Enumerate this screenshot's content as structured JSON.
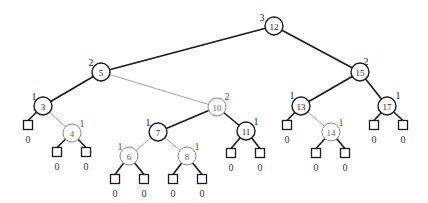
{
  "diagram": {
    "type": "red-black-tree-with-black-heights",
    "colors": {
      "black": "#1a1a1a",
      "red": "#8a8a8a",
      "background": "#ffffff"
    },
    "nodes": [
      {
        "id": "n12",
        "key": "12",
        "height": "3",
        "color": "black",
        "x": 274,
        "y": 26,
        "hx": 262,
        "hy": 17
      },
      {
        "id": "n5",
        "key": "5",
        "height": "2",
        "color": "black",
        "x": 101,
        "y": 72,
        "hx": 91,
        "hy": 62
      },
      {
        "id": "n15",
        "key": "15",
        "height": "2",
        "color": "black",
        "x": 360,
        "y": 72,
        "hx": 366,
        "hy": 61
      },
      {
        "id": "n3",
        "key": "3",
        "height": "1",
        "color": "black",
        "x": 43,
        "y": 106,
        "hx": 34,
        "hy": 96
      },
      {
        "id": "n10",
        "key": "10",
        "height": "2",
        "color": "red",
        "x": 217,
        "y": 107,
        "hx": 227,
        "hy": 96
      },
      {
        "id": "n13",
        "key": "13",
        "height": "1",
        "color": "black",
        "x": 301,
        "y": 106,
        "hx": 292,
        "hy": 95
      },
      {
        "id": "n17",
        "key": "17",
        "height": "1",
        "color": "black",
        "x": 387,
        "y": 106,
        "hx": 398,
        "hy": 95
      },
      {
        "id": "n4",
        "key": "4",
        "height": "1",
        "color": "red",
        "x": 72,
        "y": 133,
        "hx": 82,
        "hy": 123
      },
      {
        "id": "n7",
        "key": "7",
        "height": "1",
        "color": "black",
        "x": 158,
        "y": 132,
        "hx": 148,
        "hy": 122
      },
      {
        "id": "n11",
        "key": "11",
        "height": "1",
        "color": "black",
        "x": 246,
        "y": 131,
        "hx": 256,
        "hy": 121
      },
      {
        "id": "n14",
        "key": "14",
        "height": "1",
        "color": "red",
        "x": 331,
        "y": 132,
        "hx": 341,
        "hy": 122
      },
      {
        "id": "n6",
        "key": "6",
        "height": "1",
        "color": "red",
        "x": 129,
        "y": 156,
        "hx": 120,
        "hy": 146
      },
      {
        "id": "n8",
        "key": "8",
        "height": "1",
        "color": "red",
        "x": 187,
        "y": 156,
        "hx": 197,
        "hy": 146
      }
    ],
    "leaves": [
      {
        "id": "l3a",
        "parent": "n3",
        "height": "0",
        "x": 28,
        "y": 125
      },
      {
        "id": "l4a",
        "parent": "n4",
        "height": "0",
        "x": 57,
        "y": 152
      },
      {
        "id": "l4b",
        "parent": "n4",
        "height": "0",
        "x": 86,
        "y": 152
      },
      {
        "id": "l6a",
        "parent": "n6",
        "height": "0",
        "x": 115,
        "y": 179
      },
      {
        "id": "l6b",
        "parent": "n6",
        "height": "0",
        "x": 144,
        "y": 179
      },
      {
        "id": "l8a",
        "parent": "n8",
        "height": "0",
        "x": 173,
        "y": 179
      },
      {
        "id": "l8b",
        "parent": "n8",
        "height": "0",
        "x": 202,
        "y": 179
      },
      {
        "id": "l11a",
        "parent": "n11",
        "height": "0",
        "x": 231,
        "y": 153
      },
      {
        "id": "l11b",
        "parent": "n11",
        "height": "0",
        "x": 260,
        "y": 153
      },
      {
        "id": "l13a",
        "parent": "n13",
        "height": "0",
        "x": 287,
        "y": 125
      },
      {
        "id": "l14a",
        "parent": "n14",
        "height": "0",
        "x": 316,
        "y": 153
      },
      {
        "id": "l14b",
        "parent": "n14",
        "height": "0",
        "x": 345,
        "y": 153
      },
      {
        "id": "l17a",
        "parent": "n17",
        "height": "0",
        "x": 374,
        "y": 125
      },
      {
        "id": "l17b",
        "parent": "n17",
        "height": "0",
        "x": 403,
        "y": 125
      }
    ],
    "edges": [
      {
        "from": "n12",
        "to": "n5",
        "style": "black"
      },
      {
        "from": "n12",
        "to": "n15",
        "style": "black"
      },
      {
        "from": "n5",
        "to": "n3",
        "style": "black"
      },
      {
        "from": "n5",
        "to": "n10",
        "style": "gray"
      },
      {
        "from": "n15",
        "to": "n13",
        "style": "black"
      },
      {
        "from": "n15",
        "to": "n17",
        "style": "black"
      },
      {
        "from": "n3",
        "to": "l3a",
        "style": "black"
      },
      {
        "from": "n3",
        "to": "n4",
        "style": "gray"
      },
      {
        "from": "n10",
        "to": "n7",
        "style": "black"
      },
      {
        "from": "n10",
        "to": "n11",
        "style": "black"
      },
      {
        "from": "n13",
        "to": "l13a",
        "style": "black"
      },
      {
        "from": "n13",
        "to": "n14",
        "style": "gray"
      },
      {
        "from": "n17",
        "to": "l17a",
        "style": "black"
      },
      {
        "from": "n17",
        "to": "l17b",
        "style": "black"
      },
      {
        "from": "n4",
        "to": "l4a",
        "style": "black"
      },
      {
        "from": "n4",
        "to": "l4b",
        "style": "black"
      },
      {
        "from": "n7",
        "to": "n6",
        "style": "gray"
      },
      {
        "from": "n7",
        "to": "n8",
        "style": "gray"
      },
      {
        "from": "n11",
        "to": "l11a",
        "style": "black"
      },
      {
        "from": "n11",
        "to": "l11b",
        "style": "black"
      },
      {
        "from": "n14",
        "to": "l14a",
        "style": "black"
      },
      {
        "from": "n14",
        "to": "l14b",
        "style": "black"
      },
      {
        "from": "n6",
        "to": "l6a",
        "style": "black"
      },
      {
        "from": "n6",
        "to": "l6b",
        "style": "black"
      },
      {
        "from": "n8",
        "to": "l8a",
        "style": "black"
      },
      {
        "from": "n8",
        "to": "l8b",
        "style": "black"
      }
    ]
  }
}
